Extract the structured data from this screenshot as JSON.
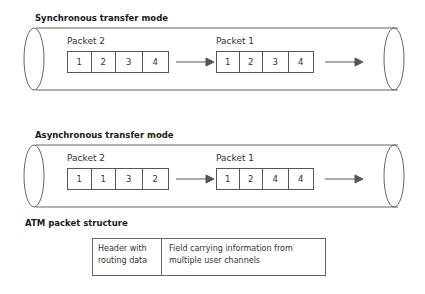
{
  "sections": [
    {
      "title": "Synchronous transfer mode",
      "packets": [
        {
          "label": "Packet 2",
          "cells": [
            "1",
            "2",
            "3",
            "4"
          ]
        },
        {
          "label": "Packet 1",
          "cells": [
            "1",
            "2",
            "3",
            "4"
          ]
        }
      ]
    },
    {
      "title": "Asynchronous transfer mode",
      "packets": [
        {
          "label": "Packet 2",
          "cells": [
            "1",
            "1",
            "3",
            "2"
          ]
        },
        {
          "label": "Packet 1",
          "cells": [
            "1",
            "2",
            "4",
            "4"
          ]
        }
      ]
    }
  ],
  "atm": {
    "title": "ATM packet structure",
    "header": [
      "Header with",
      "routing data"
    ],
    "field": [
      "Field carrying information from",
      "multiple user channels"
    ]
  },
  "colors": {
    "line": "#555555",
    "text": "#333333"
  }
}
